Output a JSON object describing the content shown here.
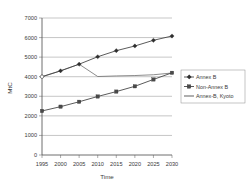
{
  "chart_data": {
    "type": "line",
    "title": "",
    "xlabel": "Time",
    "ylabel": "MtC",
    "x": [
      1995,
      2000,
      2005,
      2010,
      2015,
      2020,
      2025,
      2030
    ],
    "xtick_labels": [
      "1995",
      "2000",
      "2005",
      "2010",
      "2015",
      "2020",
      "2025",
      "2030"
    ],
    "ytick_labels": [
      "0",
      "1000",
      "2000",
      "3000",
      "4000",
      "5000",
      "6000",
      "7000"
    ],
    "ylim": [
      0,
      7000
    ],
    "xlim": [
      1995,
      2030
    ],
    "grid": true,
    "legend_position": "right",
    "series": [
      {
        "name": "Annex B",
        "marker": "diamond",
        "values": [
          4000,
          4300,
          4640,
          5020,
          5330,
          5570,
          5860,
          6080
        ]
      },
      {
        "name": "Non-Annex B",
        "marker": "square",
        "values": [
          2250,
          2470,
          2720,
          2990,
          3240,
          3510,
          3860,
          4200
        ]
      },
      {
        "name": "Annex-B, Kyoto",
        "marker": "none",
        "values": [
          4000,
          4300,
          4640,
          4010,
          4040,
          4060,
          4100,
          4190
        ]
      }
    ]
  },
  "legend": {
    "entries": [
      {
        "label": "Annex B"
      },
      {
        "label": "Non-Annex B"
      },
      {
        "label": "Annex-B, Kyoto"
      }
    ]
  },
  "axes": {
    "y_title": "MtC",
    "x_title": "Time"
  }
}
